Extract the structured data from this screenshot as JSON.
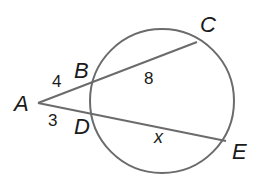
{
  "diagram": {
    "type": "geometry-secants",
    "stroke_color": "#6b6b6b",
    "text_color": "#1a1a1a",
    "circle": {
      "cx": 162,
      "cy": 101,
      "r": 72
    },
    "points": {
      "A": {
        "label": "A",
        "x": 38,
        "y": 103,
        "label_x": 14,
        "label_y": 111
      },
      "B": {
        "label": "B",
        "x": 90,
        "y": 84,
        "label_x": 74,
        "label_y": 78
      },
      "C": {
        "label": "C",
        "x": 197,
        "y": 42,
        "label_x": 200,
        "label_y": 32
      },
      "D": {
        "label": "D",
        "x": 89,
        "y": 114,
        "label_x": 74,
        "label_y": 134
      },
      "E": {
        "label": "E",
        "x": 226,
        "y": 141,
        "label_x": 232,
        "label_y": 159
      }
    },
    "segments": [
      {
        "from": "A",
        "to": "C",
        "name": "secant-ABC"
      },
      {
        "from": "A",
        "to": "E",
        "name": "secant-ADE"
      }
    ],
    "measures": {
      "AB": {
        "text": "4",
        "x": 52,
        "y": 87
      },
      "BC": {
        "text": "8",
        "x": 144,
        "y": 84
      },
      "AD": {
        "text": "3",
        "x": 48,
        "y": 126
      },
      "DE": {
        "text": "x",
        "x": 154,
        "y": 143
      }
    }
  }
}
